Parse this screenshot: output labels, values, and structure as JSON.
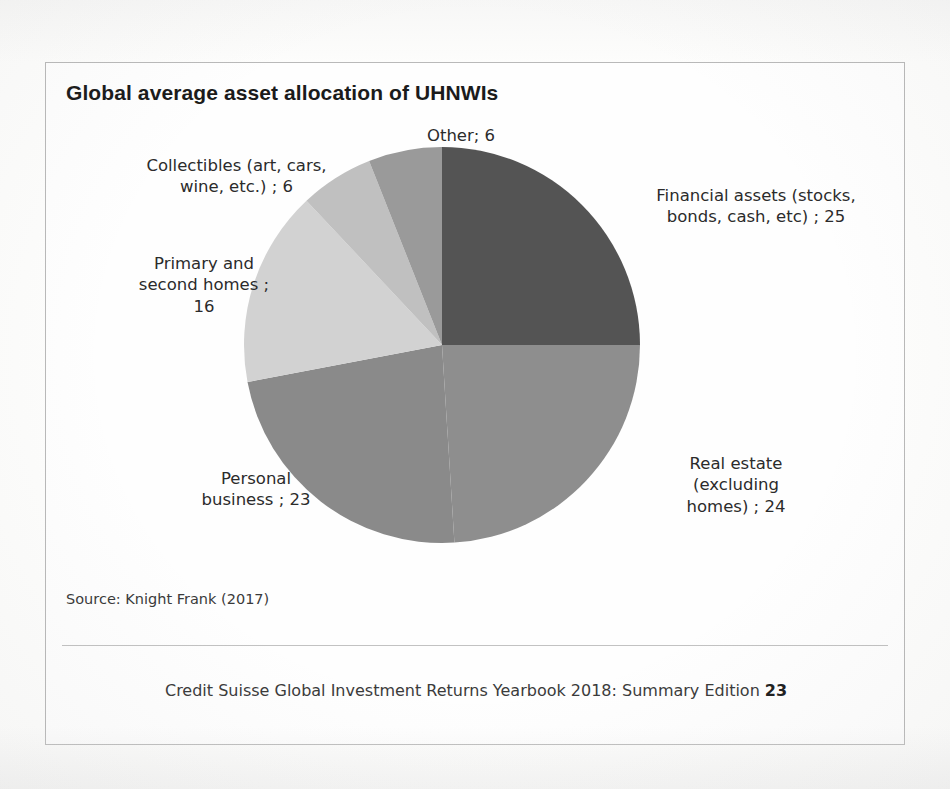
{
  "card": {
    "title": "Global average asset allocation of UHNWIs",
    "source_note": "Source: Knight Frank (2017)",
    "footer_text": "Credit Suisse Global Investment Returns Yearbook 2018: Summary Edition",
    "footer_page": "23"
  },
  "chart_data": {
    "type": "pie",
    "title": "Global average asset allocation of UHNWIs",
    "xlabel": "",
    "ylabel": "",
    "legend_position": "none",
    "grid": false,
    "units": "percent of total allocation",
    "total": 100,
    "labels": [
      "Financial assets (stocks, bonds, cash, etc)",
      "Real estate (excluding homes)",
      "Personal business",
      "Primary and second homes",
      "Collectibles (art, cars, wine, etc.)",
      "Other"
    ],
    "values": [
      25,
      24,
      23,
      16,
      6,
      6
    ],
    "colors": [
      "#545454",
      "#8e8e8e",
      "#8a8a8a",
      "#d2d2d2",
      "#c0c0c0",
      "#9a9a9a"
    ],
    "start_angle_deg": 0,
    "direction": "clockwise",
    "slices": [
      {
        "name": "financial-assets",
        "label": "Financial assets (stocks, bonds, cash, etc)",
        "value": 25,
        "display_label": "Financial assets (stocks,\nbonds, cash, etc) ; 25",
        "color": "#545454"
      },
      {
        "name": "real-estate",
        "label": "Real estate (excluding homes)",
        "value": 24,
        "display_label": "Real estate\n(excluding\nhomes) ; 24",
        "color": "#8e8e8e"
      },
      {
        "name": "personal-business",
        "label": "Personal business",
        "value": 23,
        "display_label": "Personal\nbusiness ; 23",
        "color": "#8a8a8a"
      },
      {
        "name": "primary-and-second-homes",
        "label": "Primary and second homes",
        "value": 16,
        "display_label": "Primary and\nsecond homes ;\n16",
        "color": "#d2d2d2"
      },
      {
        "name": "collectibles",
        "label": "Collectibles (art, cars, wine, etc.)",
        "value": 6,
        "display_label": "Collectibles (art, cars,\nwine, etc.) ; 6",
        "color": "#c0c0c0"
      },
      {
        "name": "other",
        "label": "Other",
        "value": 6,
        "display_label": "Other; 6",
        "color": "#9a9a9a"
      }
    ]
  }
}
